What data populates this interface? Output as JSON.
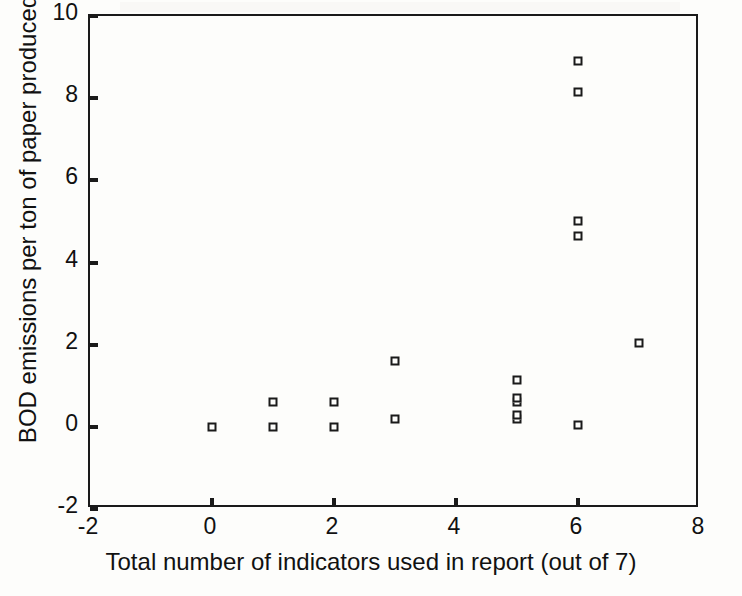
{
  "chart_data": {
    "type": "scatter",
    "title": "",
    "xlabel": "Total number of indicators used in report (out of 7)",
    "ylabel": "BOD emissions per ton of paper produced",
    "xlim": [
      -2,
      8
    ],
    "ylim": [
      -2,
      10
    ],
    "xticks": [
      -2,
      0,
      2,
      4,
      6,
      8
    ],
    "yticks": [
      -2,
      0,
      2,
      4,
      6,
      8,
      10
    ],
    "xtick_labels": [
      "-2",
      "0",
      "2",
      "4",
      "6",
      "8"
    ],
    "ytick_labels": [
      "-2",
      "0",
      "2",
      "4",
      "6",
      "8",
      "10"
    ],
    "grid": false,
    "legend": null,
    "marker": "open-square",
    "marker_color": "#1a1a1a",
    "points": [
      {
        "x": 0,
        "y": 0.0
      },
      {
        "x": 1,
        "y": 0.0
      },
      {
        "x": 1,
        "y": 0.6
      },
      {
        "x": 2,
        "y": 0.0
      },
      {
        "x": 2,
        "y": 0.6
      },
      {
        "x": 3,
        "y": 0.2
      },
      {
        "x": 3,
        "y": 1.6
      },
      {
        "x": 5,
        "y": 0.2
      },
      {
        "x": 5,
        "y": 0.3
      },
      {
        "x": 5,
        "y": 0.6
      },
      {
        "x": 5,
        "y": 0.7
      },
      {
        "x": 5,
        "y": 1.15
      },
      {
        "x": 6,
        "y": 0.05
      },
      {
        "x": 6,
        "y": 4.65
      },
      {
        "x": 6,
        "y": 5.0
      },
      {
        "x": 6,
        "y": 8.15
      },
      {
        "x": 6,
        "y": 8.9
      },
      {
        "x": 7,
        "y": 2.05
      }
    ]
  }
}
